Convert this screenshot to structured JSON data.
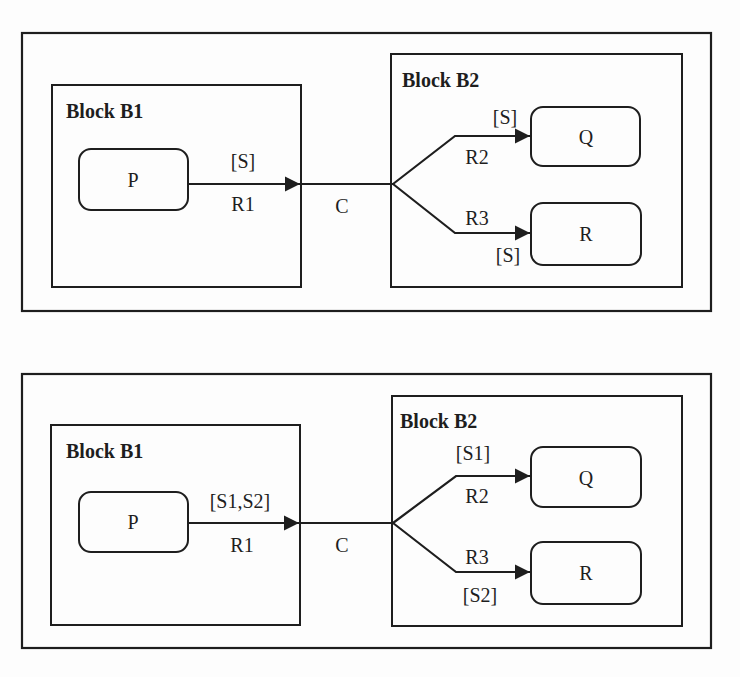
{
  "diagrams": [
    {
      "blocks": [
        {
          "label": "Block B1",
          "states": [
            "P"
          ]
        },
        {
          "label": "Block B2",
          "states": [
            "Q",
            "R"
          ]
        }
      ],
      "edges": {
        "r1": {
          "name": "R1",
          "guard": "[S]"
        },
        "c": {
          "name": "C"
        },
        "r2": {
          "name": "R2",
          "guard": "[S]"
        },
        "r3": {
          "name": "R3",
          "guard": "[S]"
        }
      }
    },
    {
      "blocks": [
        {
          "label": "Block B1",
          "states": [
            "P"
          ]
        },
        {
          "label": "Block B2",
          "states": [
            "Q",
            "R"
          ]
        }
      ],
      "edges": {
        "r1": {
          "name": "R1",
          "guard": "[S1,S2]"
        },
        "c": {
          "name": "C"
        },
        "r2": {
          "name": "R2",
          "guard": "[S1]"
        },
        "r3": {
          "name": "R3",
          "guard": "[S2]"
        }
      }
    }
  ]
}
